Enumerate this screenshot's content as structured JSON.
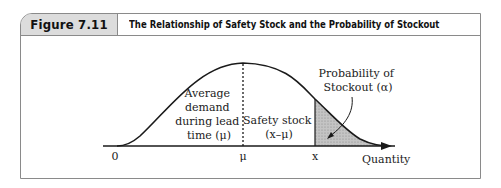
{
  "figure": {
    "number": "Figure 7.11",
    "title": "The Relationship of Safety Stock and the Probability of Stockout"
  },
  "diagram": {
    "labels": {
      "average_demand": [
        "Average",
        "demand",
        "during lead",
        "time (μ)"
      ],
      "safety_stock": [
        "Safety stock",
        "(x–μ)"
      ],
      "probability_stockout": [
        "Probability of",
        "Stockout (α)"
      ],
      "axis_zero": "0",
      "axis_mu": "μ",
      "axis_x": "x",
      "axis_title": "Quantity"
    },
    "colors": {
      "curve": "#1a1a1a",
      "shaded_area": "#bdbdbd",
      "frame": "#8a8a8a",
      "tab_fill": "#dcdcdc"
    }
  }
}
